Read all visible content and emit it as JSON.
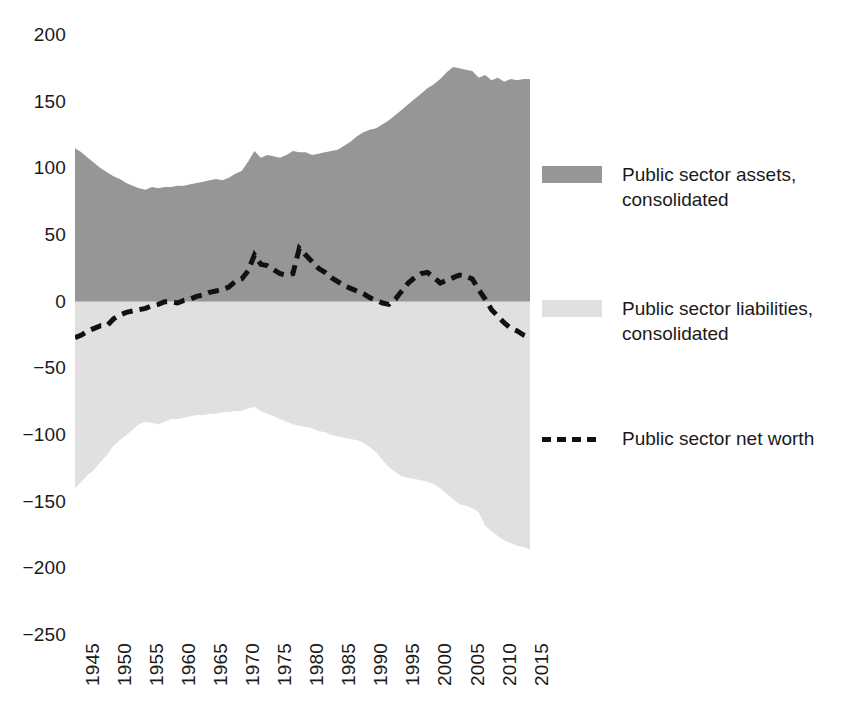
{
  "chart_data": {
    "type": "area",
    "title": "",
    "subtitle": "",
    "xlabel": "",
    "ylabel": "",
    "xlim": [
      1945,
      2016
    ],
    "ylim": [
      -250,
      200
    ],
    "grid": false,
    "legend_position": "right",
    "y_ticks": [
      200,
      150,
      100,
      50,
      0,
      -50,
      -100,
      -150,
      -200,
      -250
    ],
    "y_tick_labels": [
      "200",
      "150",
      "100",
      "50",
      "0",
      "−50",
      "−100",
      "−150",
      "−200",
      "−250"
    ],
    "x_ticks": [
      1945,
      1950,
      1955,
      1960,
      1965,
      1970,
      1975,
      1980,
      1985,
      1990,
      1995,
      2000,
      2005,
      2010,
      2015
    ],
    "x_tick_labels": [
      "1945",
      "1950",
      "1955",
      "1960",
      "1965",
      "1970",
      "1975",
      "1980",
      "1985",
      "1990",
      "1995",
      "2000",
      "2005",
      "2010",
      "2015"
    ],
    "x": [
      1945,
      1946,
      1947,
      1948,
      1949,
      1950,
      1951,
      1952,
      1953,
      1954,
      1955,
      1956,
      1957,
      1958,
      1959,
      1960,
      1961,
      1962,
      1963,
      1964,
      1965,
      1966,
      1967,
      1968,
      1969,
      1970,
      1971,
      1972,
      1973,
      1974,
      1975,
      1976,
      1977,
      1978,
      1979,
      1980,
      1981,
      1982,
      1983,
      1984,
      1985,
      1986,
      1987,
      1988,
      1989,
      1990,
      1991,
      1992,
      1993,
      1994,
      1995,
      1996,
      1997,
      1998,
      1999,
      2000,
      2001,
      2002,
      2003,
      2004,
      2005,
      2006,
      2007,
      2008,
      2009,
      2010,
      2011,
      2012,
      2013,
      2014,
      2015,
      2016
    ],
    "series": [
      {
        "name": "Public sector assets, consolidated",
        "color": "#969696",
        "kind": "area-positive",
        "values": [
          115,
          112,
          108,
          104,
          100,
          97,
          94,
          92,
          89,
          87,
          85,
          84,
          86,
          85,
          86,
          86,
          87,
          87,
          88,
          89,
          90,
          91,
          92,
          91,
          93,
          96,
          98,
          105,
          113,
          108,
          110,
          109,
          108,
          110,
          113,
          112,
          112,
          110,
          111,
          112,
          113,
          114,
          117,
          120,
          124,
          127,
          129,
          130,
          133,
          136,
          140,
          144,
          148,
          152,
          156,
          160,
          163,
          167,
          172,
          176,
          175,
          174,
          173,
          168,
          170,
          166,
          168,
          165,
          167,
          166,
          167,
          167
        ]
      },
      {
        "name": "Public sector liabilities, consolidated",
        "color": "#e0e0e0",
        "kind": "area-negative",
        "values": [
          -140,
          -135,
          -130,
          -126,
          -120,
          -115,
          -108,
          -104,
          -100,
          -96,
          -92,
          -90,
          -91,
          -92,
          -90,
          -88,
          -88,
          -87,
          -86,
          -85,
          -85,
          -84,
          -84,
          -83,
          -83,
          -82,
          -82,
          -80,
          -79,
          -82,
          -84,
          -86,
          -88,
          -90,
          -92,
          -93,
          -94,
          -95,
          -97,
          -98,
          -100,
          -101,
          -102,
          -103,
          -104,
          -106,
          -109,
          -113,
          -119,
          -124,
          -128,
          -131,
          -132,
          -133,
          -134,
          -135,
          -137,
          -140,
          -144,
          -148,
          -152,
          -153,
          -155,
          -158,
          -168,
          -172,
          -176,
          -179,
          -181,
          -183,
          -184,
          -186
        ]
      },
      {
        "name": "Public sector net worth",
        "color": "#111111",
        "kind": "line-dashed",
        "values": [
          -27,
          -25,
          -22,
          -20,
          -18,
          -18,
          -13,
          -10,
          -8,
          -7,
          -6,
          -5,
          -3,
          -2,
          0,
          0,
          -1,
          1,
          2,
          4,
          5,
          7,
          8,
          9,
          11,
          15,
          17,
          23,
          35,
          28,
          27,
          24,
          21,
          20,
          21,
          40,
          35,
          30,
          25,
          22,
          18,
          15,
          12,
          10,
          8,
          6,
          3,
          1,
          -1,
          -2,
          2,
          8,
          14,
          18,
          21,
          22,
          18,
          14,
          16,
          18,
          20,
          19,
          17,
          9,
          2,
          -6,
          -11,
          -16,
          -20,
          -22,
          -25,
          -27
        ]
      }
    ]
  },
  "legend": {
    "items": [
      {
        "label": "Public sector assets,",
        "label2": "consolidated",
        "marker": "swatch",
        "color": "#969696",
        "top": 162
      },
      {
        "label": "Public sector liabilities,",
        "label2": "consolidated",
        "marker": "swatch",
        "color": "#e0e0e0",
        "top": 296
      },
      {
        "label": "Public sector net worth",
        "label2": "",
        "marker": "dash",
        "color": "#111111",
        "top": 426
      }
    ]
  }
}
